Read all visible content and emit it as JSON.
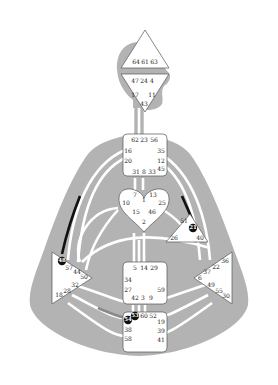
{
  "diagram": {
    "type": "human-design-bodygraph",
    "colors": {
      "background": "#ffffff",
      "body": "#b3b3b3",
      "channel": "#ffffff",
      "center_fill": "#ffffff",
      "center_stroke": "#555555",
      "active_line": "#111111",
      "partial_line": "#8a8a8a"
    },
    "centers": {
      "head": {
        "shape": "triangle-up",
        "gates": [
          "64",
          "61",
          "63"
        ]
      },
      "ajna": {
        "shape": "triangle-down",
        "gates": [
          "47",
          "24",
          "4",
          "17",
          "11",
          "43"
        ]
      },
      "throat": {
        "shape": "square",
        "gates": [
          "62",
          "23",
          "56",
          "16",
          "35",
          "20",
          "12",
          "31",
          "8",
          "33",
          "45"
        ]
      },
      "g": {
        "shape": "heart",
        "gates": [
          "7",
          "1",
          "13",
          "10",
          "25",
          "15",
          "46",
          "2"
        ]
      },
      "ego": {
        "shape": "triangle",
        "gates": [
          "51",
          "21",
          "26",
          "40"
        ],
        "active_gates": [
          "21"
        ]
      },
      "spleen": {
        "shape": "triangle-right",
        "gates": [
          "48",
          "57",
          "44",
          "50",
          "32",
          "28",
          "18"
        ],
        "active_gates": [
          "48"
        ]
      },
      "solar_plexus": {
        "shape": "triangle-left",
        "gates": [
          "36",
          "22",
          "37",
          "6",
          "49",
          "55",
          "30"
        ]
      },
      "sacral": {
        "shape": "square",
        "gates": [
          "5",
          "14",
          "29",
          "34",
          "27",
          "59",
          "42",
          "3",
          "9"
        ]
      },
      "root": {
        "shape": "square",
        "gates": [
          "54",
          "53",
          "60",
          "52",
          "19",
          "38",
          "39",
          "58",
          "41"
        ],
        "active_gates": [
          "54",
          "53"
        ]
      }
    }
  }
}
